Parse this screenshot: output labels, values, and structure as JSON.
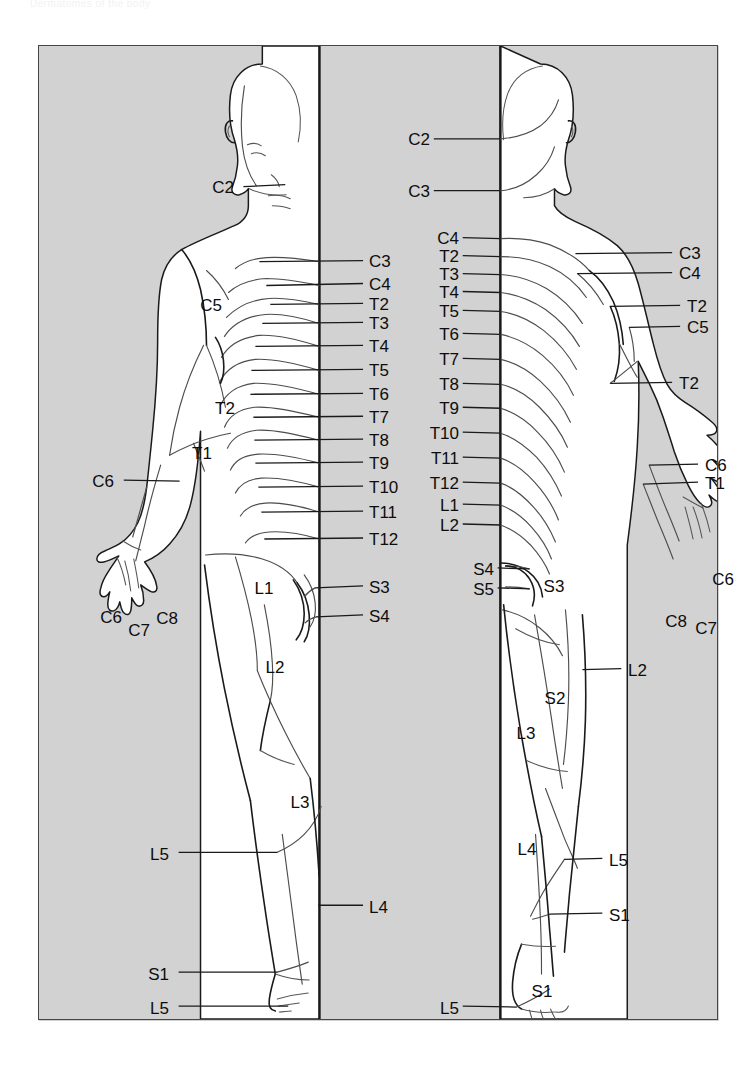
{
  "document": {
    "caption": "Dermatomes of the body",
    "panel_background": "#d2d2d2",
    "panel_border": "#44474a",
    "skin_fill": "#ffffff",
    "line_color": "#1a1a1a",
    "label_color": "#0d0d0d"
  },
  "figures": [
    {
      "id": "anterior",
      "name": "anterior-figure"
    },
    {
      "id": "posterior",
      "name": "posterior-figure"
    }
  ],
  "chart_data": {
    "type": "diagram",
    "title": "Dermatomes of the body",
    "views": [
      "anterior",
      "posterior"
    ],
    "segments_shown": [
      "C2",
      "C3",
      "C4",
      "C5",
      "C6",
      "C7",
      "C8",
      "T1",
      "T2",
      "T3",
      "T4",
      "T5",
      "T6",
      "T7",
      "T8",
      "T9",
      "T10",
      "T11",
      "T12",
      "L1",
      "L2",
      "L3",
      "L4",
      "L5",
      "S1",
      "S2",
      "S3",
      "S4",
      "S5"
    ],
    "anterior_labels": [
      "C2",
      "C3",
      "C4",
      "C5",
      "C6",
      "C6",
      "C7",
      "C8",
      "T1",
      "T2",
      "T2",
      "T3",
      "T4",
      "T5",
      "T6",
      "T7",
      "T8",
      "T9",
      "T10",
      "T11",
      "T12",
      "L1",
      "L2",
      "L3",
      "L4",
      "L5",
      "L5",
      "S1",
      "S3",
      "S4"
    ],
    "posterior_labels": [
      "C2",
      "C3",
      "C3",
      "C4",
      "C4",
      "C5",
      "C6",
      "C6",
      "C7",
      "C8",
      "T1",
      "T2",
      "T2",
      "T3",
      "T4",
      "T5",
      "T6",
      "T7",
      "T8",
      "T9",
      "T10",
      "T11",
      "T12",
      "L1",
      "L2",
      "L2",
      "L3",
      "L4",
      "L5",
      "L5",
      "S1",
      "S1",
      "S2",
      "S3",
      "S4",
      "S5"
    ]
  },
  "labels": {
    "anterior": [
      {
        "text": "C2",
        "x": 195,
        "y": 141,
        "align": "r",
        "lead": {
          "x1": 205,
          "y1": 141,
          "x2": 247,
          "y2": 139
        }
      },
      {
        "text": "C3",
        "x": 330,
        "y": 215,
        "align": "l",
        "lead": {
          "x1": 325,
          "y1": 215,
          "x2": 221,
          "y2": 216
        }
      },
      {
        "text": "C4",
        "x": 330,
        "y": 238,
        "align": "l",
        "lead": {
          "x1": 325,
          "y1": 238,
          "x2": 228,
          "y2": 240
        }
      },
      {
        "text": "T2",
        "x": 330,
        "y": 258,
        "align": "l",
        "lead": {
          "x1": 325,
          "y1": 258,
          "x2": 232,
          "y2": 259
        }
      },
      {
        "text": "T3",
        "x": 330,
        "y": 277,
        "align": "l",
        "lead": {
          "x1": 325,
          "y1": 277,
          "x2": 224,
          "y2": 278
        }
      },
      {
        "text": "T4",
        "x": 330,
        "y": 300,
        "align": "l",
        "lead": {
          "x1": 325,
          "y1": 300,
          "x2": 217,
          "y2": 301
        }
      },
      {
        "text": "T5",
        "x": 330,
        "y": 324,
        "align": "l",
        "lead": {
          "x1": 325,
          "y1": 324,
          "x2": 213,
          "y2": 325
        }
      },
      {
        "text": "T6",
        "x": 330,
        "y": 348,
        "align": "l",
        "lead": {
          "x1": 325,
          "y1": 348,
          "x2": 212,
          "y2": 349
        }
      },
      {
        "text": "T7",
        "x": 330,
        "y": 371,
        "align": "l",
        "lead": {
          "x1": 325,
          "y1": 371,
          "x2": 215,
          "y2": 372
        }
      },
      {
        "text": "T8",
        "x": 330,
        "y": 394,
        "align": "l",
        "lead": {
          "x1": 325,
          "y1": 394,
          "x2": 216,
          "y2": 395
        }
      },
      {
        "text": "T9",
        "x": 330,
        "y": 417,
        "align": "l",
        "lead": {
          "x1": 325,
          "y1": 417,
          "x2": 217,
          "y2": 418
        }
      },
      {
        "text": "T10",
        "x": 330,
        "y": 441,
        "align": "l",
        "lead": {
          "x1": 325,
          "y1": 441,
          "x2": 220,
          "y2": 442
        }
      },
      {
        "text": "T11",
        "x": 330,
        "y": 466,
        "align": "l",
        "lead": {
          "x1": 325,
          "y1": 466,
          "x2": 223,
          "y2": 467
        }
      },
      {
        "text": "T12",
        "x": 330,
        "y": 493,
        "align": "l",
        "lead": {
          "x1": 325,
          "y1": 493,
          "x2": 226,
          "y2": 494
        }
      },
      {
        "text": "C5",
        "x": 172,
        "y": 259,
        "align": "c",
        "lead": null
      },
      {
        "text": "T2",
        "x": 186,
        "y": 362,
        "align": "c",
        "lead": null
      },
      {
        "text": "T1",
        "x": 163,
        "y": 407,
        "align": "c",
        "lead": null
      },
      {
        "text": "C6",
        "x": 75,
        "y": 435,
        "align": "r",
        "lead": {
          "x1": 85,
          "y1": 435,
          "x2": 141,
          "y2": 436
        }
      },
      {
        "text": "C6",
        "x": 72,
        "y": 571,
        "align": "c",
        "lead": null
      },
      {
        "text": "C7",
        "x": 100,
        "y": 584,
        "align": "c",
        "lead": null
      },
      {
        "text": "C8",
        "x": 128,
        "y": 572,
        "align": "c",
        "lead": null
      },
      {
        "text": "L1",
        "x": 225,
        "y": 542,
        "align": "c",
        "lead": null
      },
      {
        "text": "S3",
        "x": 330,
        "y": 541,
        "align": "l",
        "lead": {
          "x1": 325,
          "y1": 541,
          "x2": 277,
          "y2": 543
        }
      },
      {
        "text": "S4",
        "x": 330,
        "y": 570,
        "align": "l",
        "lead": {
          "x1": 325,
          "y1": 570,
          "x2": 278,
          "y2": 572
        }
      },
      {
        "text": "L2",
        "x": 236,
        "y": 621,
        "align": "c",
        "lead": null
      },
      {
        "text": "L3",
        "x": 261,
        "y": 756,
        "align": "c",
        "lead": null
      },
      {
        "text": "L5",
        "x": 130,
        "y": 808,
        "align": "r",
        "lead": {
          "x1": 140,
          "y1": 808,
          "x2": 239,
          "y2": 808
        }
      },
      {
        "text": "L4",
        "x": 330,
        "y": 861,
        "align": "l",
        "lead": {
          "x1": 325,
          "y1": 861,
          "x2": 280,
          "y2": 861
        }
      },
      {
        "text": "S1",
        "x": 130,
        "y": 928,
        "align": "r",
        "lead": {
          "x1": 140,
          "y1": 928,
          "x2": 239,
          "y2": 928
        }
      },
      {
        "text": "L5",
        "x": 130,
        "y": 962,
        "align": "r",
        "lead": {
          "x1": 140,
          "y1": 962,
          "x2": 250,
          "y2": 962
        }
      }
    ],
    "posterior": [
      {
        "text": "C2",
        "x": 391,
        "y": 93,
        "align": "r",
        "lead": {
          "x1": 396,
          "y1": 93,
          "x2": 462,
          "y2": 93
        }
      },
      {
        "text": "C3",
        "x": 391,
        "y": 145,
        "align": "r",
        "lead": {
          "x1": 396,
          "y1": 145,
          "x2": 462,
          "y2": 145
        }
      },
      {
        "text": "C4",
        "x": 420,
        "y": 192,
        "align": "r",
        "lead": {
          "x1": 425,
          "y1": 192,
          "x2": 463,
          "y2": 193
        }
      },
      {
        "text": "T2",
        "x": 420,
        "y": 210,
        "align": "r",
        "lead": {
          "x1": 425,
          "y1": 210,
          "x2": 463,
          "y2": 211
        }
      },
      {
        "text": "T3",
        "x": 420,
        "y": 228,
        "align": "r",
        "lead": {
          "x1": 425,
          "y1": 228,
          "x2": 463,
          "y2": 229
        }
      },
      {
        "text": "T4",
        "x": 420,
        "y": 246,
        "align": "r",
        "lead": {
          "x1": 425,
          "y1": 246,
          "x2": 463,
          "y2": 247
        }
      },
      {
        "text": "T5",
        "x": 420,
        "y": 265,
        "align": "r",
        "lead": {
          "x1": 425,
          "y1": 265,
          "x2": 463,
          "y2": 266
        }
      },
      {
        "text": "T6",
        "x": 420,
        "y": 288,
        "align": "r",
        "lead": {
          "x1": 425,
          "y1": 288,
          "x2": 463,
          "y2": 289
        }
      },
      {
        "text": "T7",
        "x": 420,
        "y": 313,
        "align": "r",
        "lead": {
          "x1": 425,
          "y1": 313,
          "x2": 463,
          "y2": 314
        }
      },
      {
        "text": "T8",
        "x": 420,
        "y": 338,
        "align": "r",
        "lead": {
          "x1": 425,
          "y1": 338,
          "x2": 463,
          "y2": 339
        }
      },
      {
        "text": "T9",
        "x": 420,
        "y": 362,
        "align": "r",
        "lead": {
          "x1": 425,
          "y1": 362,
          "x2": 463,
          "y2": 363
        }
      },
      {
        "text": "T10",
        "x": 420,
        "y": 387,
        "align": "r",
        "lead": {
          "x1": 425,
          "y1": 387,
          "x2": 463,
          "y2": 388
        }
      },
      {
        "text": "T11",
        "x": 420,
        "y": 412,
        "align": "r",
        "lead": {
          "x1": 425,
          "y1": 412,
          "x2": 463,
          "y2": 413
        }
      },
      {
        "text": "T12",
        "x": 420,
        "y": 437,
        "align": "r",
        "lead": {
          "x1": 425,
          "y1": 437,
          "x2": 463,
          "y2": 438
        }
      },
      {
        "text": "L1",
        "x": 420,
        "y": 459,
        "align": "r",
        "lead": {
          "x1": 425,
          "y1": 459,
          "x2": 463,
          "y2": 460
        }
      },
      {
        "text": "L2",
        "x": 420,
        "y": 479,
        "align": "r",
        "lead": {
          "x1": 425,
          "y1": 479,
          "x2": 463,
          "y2": 480
        }
      },
      {
        "text": "S4",
        "x": 455,
        "y": 523,
        "align": "r",
        "lead": {
          "x1": 460,
          "y1": 523,
          "x2": 492,
          "y2": 524
        }
      },
      {
        "text": "S5",
        "x": 455,
        "y": 543,
        "align": "r",
        "lead": {
          "x1": 460,
          "y1": 543,
          "x2": 492,
          "y2": 544
        }
      },
      {
        "text": "C3",
        "x": 640,
        "y": 207,
        "align": "l",
        "lead": {
          "x1": 635,
          "y1": 207,
          "x2": 538,
          "y2": 208
        }
      },
      {
        "text": "C4",
        "x": 640,
        "y": 227,
        "align": "l",
        "lead": {
          "x1": 635,
          "y1": 227,
          "x2": 540,
          "y2": 228
        }
      },
      {
        "text": "T2",
        "x": 648,
        "y": 260,
        "align": "l",
        "lead": {
          "x1": 643,
          "y1": 260,
          "x2": 573,
          "y2": 261
        }
      },
      {
        "text": "C5",
        "x": 648,
        "y": 281,
        "align": "l",
        "lead": {
          "x1": 643,
          "y1": 281,
          "x2": 592,
          "y2": 282
        }
      },
      {
        "text": "T2",
        "x": 640,
        "y": 337,
        "align": "l",
        "lead": {
          "x1": 635,
          "y1": 337,
          "x2": 573,
          "y2": 338
        }
      },
      {
        "text": "C6",
        "x": 666,
        "y": 419,
        "align": "l",
        "lead": {
          "x1": 661,
          "y1": 419,
          "x2": 612,
          "y2": 420
        }
      },
      {
        "text": "T1",
        "x": 666,
        "y": 437,
        "align": "l",
        "lead": {
          "x1": 661,
          "y1": 437,
          "x2": 606,
          "y2": 439
        }
      },
      {
        "text": "C6",
        "x": 684,
        "y": 533,
        "align": "c",
        "lead": null
      },
      {
        "text": "C8",
        "x": 637,
        "y": 575,
        "align": "c",
        "lead": null
      },
      {
        "text": "C7",
        "x": 667,
        "y": 582,
        "align": "c",
        "lead": null
      },
      {
        "text": "S3",
        "x": 515,
        "y": 540,
        "align": "c",
        "lead": null
      },
      {
        "text": "L2",
        "x": 589,
        "y": 624,
        "align": "l",
        "lead": {
          "x1": 584,
          "y1": 624,
          "x2": 545,
          "y2": 625
        }
      },
      {
        "text": "S2",
        "x": 516,
        "y": 652,
        "align": "c",
        "lead": null
      },
      {
        "text": "L3",
        "x": 487,
        "y": 687,
        "align": "c",
        "lead": null
      },
      {
        "text": "L4",
        "x": 488,
        "y": 803,
        "align": "c",
        "lead": null
      },
      {
        "text": "L5",
        "x": 570,
        "y": 814,
        "align": "l",
        "lead": {
          "x1": 565,
          "y1": 814,
          "x2": 527,
          "y2": 815
        }
      },
      {
        "text": "S1",
        "x": 570,
        "y": 869,
        "align": "l",
        "lead": {
          "x1": 565,
          "y1": 869,
          "x2": 512,
          "y2": 870
        }
      },
      {
        "text": "S1",
        "x": 503,
        "y": 945,
        "align": "c",
        "lead": null
      },
      {
        "text": "L5",
        "x": 420,
        "y": 962,
        "align": "r",
        "lead": {
          "x1": 425,
          "y1": 962,
          "x2": 479,
          "y2": 963
        }
      }
    ]
  }
}
